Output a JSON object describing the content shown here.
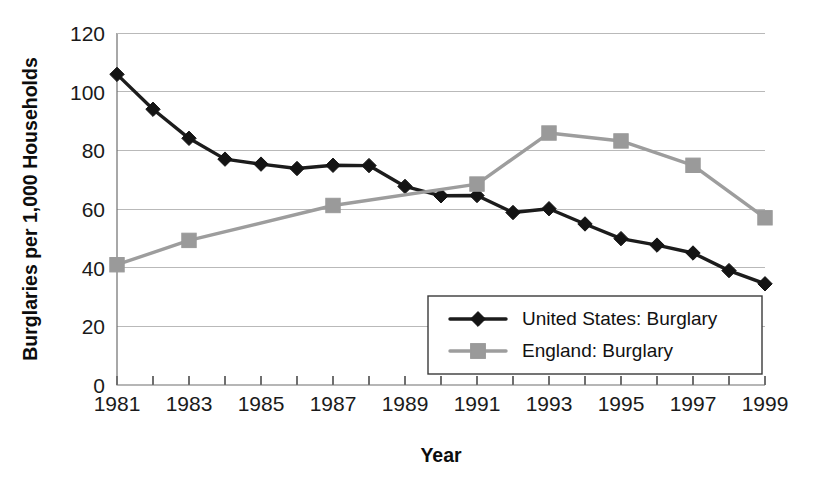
{
  "chart_data": {
    "type": "line",
    "title": "",
    "xlabel": "Year",
    "ylabel": "Burglaries per 1,000 Households",
    "xlim": [
      1981,
      1999
    ],
    "ylim": [
      0,
      120
    ],
    "yticks": [
      0,
      20,
      40,
      60,
      80,
      100,
      120
    ],
    "xticks": [
      1981,
      1983,
      1985,
      1987,
      1989,
      1991,
      1993,
      1995,
      1997,
      1999
    ],
    "xtick_labels": [
      "1981",
      "1983",
      "1985",
      "1987",
      "1989",
      "1991",
      "1993",
      "1995",
      "1997",
      "1999"
    ],
    "ytick_labels": [
      "0",
      "20",
      "40",
      "60",
      "80",
      "100",
      "120"
    ],
    "x": [
      1981,
      1982,
      1983,
      1984,
      1985,
      1986,
      1987,
      1988,
      1989,
      1990,
      1991,
      1992,
      1993,
      1994,
      1995,
      1996,
      1997,
      1998,
      1999
    ],
    "grid": "horizontal",
    "legend_position": "bottom-right",
    "series": [
      {
        "name": "United States: Burglary",
        "color": "#141414",
        "marker": "diamond",
        "x": [
          1981,
          1982,
          1983,
          1984,
          1985,
          1986,
          1987,
          1988,
          1989,
          1990,
          1991,
          1992,
          1993,
          1994,
          1995,
          1996,
          1997,
          1998,
          1999
        ],
        "values": [
          105.9,
          94.0,
          84.1,
          77.0,
          75.3,
          73.8,
          74.9,
          74.8,
          67.7,
          64.5,
          64.6,
          58.8,
          60.1,
          54.9,
          49.9,
          47.7,
          45.0,
          39.0,
          34.5
        ]
      },
      {
        "name": "England: Burglary",
        "color": "#9a9a9a",
        "marker": "square",
        "x": [
          1981,
          1983,
          1987,
          1991,
          1993,
          1995,
          1997,
          1999
        ],
        "values": [
          41.0,
          49.3,
          61.2,
          68.5,
          85.9,
          83.2,
          74.9,
          57.0
        ]
      }
    ]
  },
  "legend": {
    "entries": [
      {
        "label": "United States: Burglary"
      },
      {
        "label": "England: Burglary"
      }
    ]
  },
  "axes": {
    "y_title": "Burglaries per 1,000 Households",
    "x_title": "Year"
  }
}
